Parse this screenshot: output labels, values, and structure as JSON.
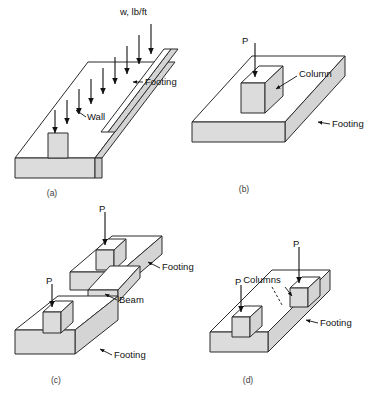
{
  "figure": {
    "colors": {
      "face_top": "#ffffff",
      "face_side": "#d4d4d4",
      "face_front": "#dcdcdc",
      "outline": "#2b2b2b",
      "text": "#111111",
      "caption": "#3a3a3a",
      "background": "#ffffff"
    }
  },
  "panels": [
    {
      "id": "a",
      "caption": "(a)",
      "type": "wall-footing",
      "load_label": "w, lb/ft",
      "load_arrow_count": 8,
      "annotations": [
        {
          "name": "wall",
          "text": "Wall"
        },
        {
          "name": "footing",
          "text": "Footing"
        }
      ]
    },
    {
      "id": "b",
      "caption": "(b)",
      "type": "isolated-spread-footing",
      "load_label": "P",
      "load_arrow_count": 1,
      "annotations": [
        {
          "name": "column",
          "text": "Column"
        },
        {
          "name": "footing",
          "text": "Footing"
        }
      ]
    },
    {
      "id": "c",
      "caption": "(c)",
      "type": "strap-combined-footing",
      "load_label": "P",
      "load_arrow_count": 2,
      "annotations": [
        {
          "name": "footing-upper",
          "text": "Footing"
        },
        {
          "name": "beam",
          "text": "Beam"
        },
        {
          "name": "footing-lower",
          "text": "Footing"
        }
      ]
    },
    {
      "id": "d",
      "caption": "(d)",
      "type": "combined-footing",
      "load_label": "P",
      "load_arrow_count": 2,
      "annotations": [
        {
          "name": "columns",
          "text": "Columns"
        },
        {
          "name": "footing",
          "text": "Footing"
        }
      ]
    }
  ]
}
